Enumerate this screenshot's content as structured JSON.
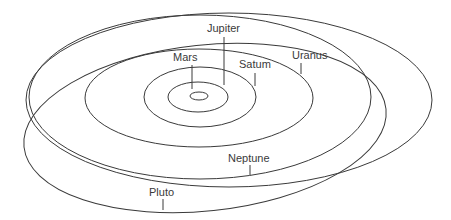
{
  "diagram": {
    "type": "orbit-diagram",
    "stroke_color": "#3a3a3a",
    "background": "#ffffff",
    "labels": {
      "mars": "Mars",
      "jupiter": "Jupiter",
      "saturn": "Satum",
      "uranus": "Uranus",
      "neptune": "Neptune",
      "pluto": "Pluto"
    },
    "orbits": [
      {
        "name": "inner",
        "cx": 199,
        "cy": 96,
        "rx": 9,
        "ry": 4
      },
      {
        "name": "mars",
        "cx": 198,
        "cy": 97,
        "rx": 31,
        "ry": 15
      },
      {
        "name": "jupiter",
        "cx": 200,
        "cy": 97,
        "rx": 56,
        "ry": 30
      },
      {
        "name": "saturn",
        "cx": 199,
        "cy": 97,
        "rx": 114,
        "ry": 50
      },
      {
        "name": "uranus",
        "cx": 200,
        "cy": 97,
        "rx": 171,
        "ry": 83
      },
      {
        "name": "pluto",
        "cx": 227,
        "cy": 112,
        "rx": 205,
        "ry": 97
      }
    ]
  }
}
